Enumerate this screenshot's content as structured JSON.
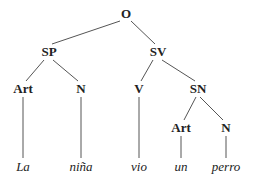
{
  "diagram": {
    "type": "syntax-tree",
    "nodes": {
      "O": {
        "label": "O",
        "x": 126,
        "y": 14
      },
      "SP": {
        "label": "SP",
        "x": 49,
        "y": 52
      },
      "SV": {
        "label": "SV",
        "x": 158,
        "y": 52
      },
      "Art1": {
        "label": "Art",
        "x": 23,
        "y": 89
      },
      "N1": {
        "label": "N",
        "x": 81,
        "y": 89
      },
      "V": {
        "label": "V",
        "x": 139,
        "y": 89
      },
      "SN": {
        "label": "SN",
        "x": 198,
        "y": 89
      },
      "Art2": {
        "label": "Art",
        "x": 181,
        "y": 128
      },
      "N2": {
        "label": "N",
        "x": 226,
        "y": 128
      }
    },
    "words": [
      {
        "text": "La",
        "x": 23,
        "y": 167
      },
      {
        "text": "niña",
        "x": 81,
        "y": 167
      },
      {
        "text": "vio",
        "x": 139,
        "y": 167
      },
      {
        "text": "un",
        "x": 181,
        "y": 167
      },
      {
        "text": "perro",
        "x": 226,
        "y": 167
      }
    ],
    "edges": [
      [
        "O",
        "SP"
      ],
      [
        "O",
        "SV"
      ],
      [
        "SP",
        "Art1"
      ],
      [
        "SP",
        "N1"
      ],
      [
        "SV",
        "V"
      ],
      [
        "SV",
        "SN"
      ],
      [
        "SN",
        "Art2"
      ],
      [
        "SN",
        "N2"
      ],
      [
        "Art1",
        "word0"
      ],
      [
        "N1",
        "word1"
      ],
      [
        "V",
        "word2"
      ],
      [
        "Art2",
        "word3"
      ],
      [
        "N2",
        "word4"
      ]
    ],
    "colors": {
      "line": "#555555",
      "text": "#222222",
      "background": "#ffffff"
    }
  }
}
